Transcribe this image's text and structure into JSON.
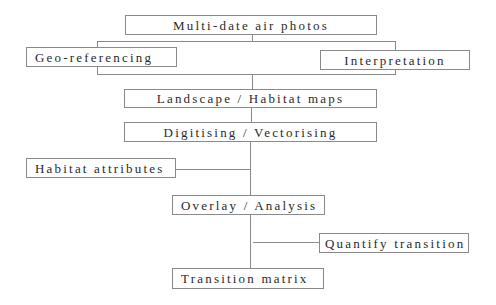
{
  "diagram": {
    "type": "flowchart",
    "nodes": [
      {
        "id": "air_photos",
        "label": "Multi-date air photos"
      },
      {
        "id": "georef",
        "label": "Geo-referencing"
      },
      {
        "id": "interp",
        "label": "Interpretation"
      },
      {
        "id": "maps",
        "label": "Landscape / Habitat maps"
      },
      {
        "id": "digitise",
        "label": "Digitising / Vectorising"
      },
      {
        "id": "attributes",
        "label": "Habitat attributes"
      },
      {
        "id": "overlay",
        "label": "Overlay / Analysis"
      },
      {
        "id": "quantify",
        "label": "Quantify transition"
      },
      {
        "id": "matrix",
        "label": "Transition matrix"
      }
    ],
    "edges": [
      {
        "from": "air_photos",
        "to": "georef"
      },
      {
        "from": "air_photos",
        "to": "interp"
      },
      {
        "from": "georef",
        "to": "maps"
      },
      {
        "from": "interp",
        "to": "maps"
      },
      {
        "from": "maps",
        "to": "digitise"
      },
      {
        "from": "digitise",
        "to": "overlay"
      },
      {
        "from": "attributes",
        "to": "overlay"
      },
      {
        "from": "overlay",
        "to": "matrix"
      },
      {
        "from": "quantify",
        "to": "matrix"
      }
    ],
    "colors": {
      "border": "#8a8a8a",
      "text": "#2a2a2a",
      "background": "#ffffff"
    }
  }
}
